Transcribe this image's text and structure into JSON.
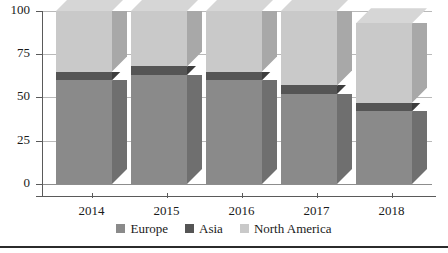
{
  "chart_data": {
    "type": "bar",
    "subtype": "stacked-3d-column",
    "title": "",
    "xlabel": "",
    "ylabel": "",
    "categories": [
      "2014",
      "2015",
      "2016",
      "2017",
      "2018"
    ],
    "ylim": [
      0,
      100
    ],
    "yticks": [
      0,
      25,
      50,
      75,
      100
    ],
    "ytick_labels": [
      "0",
      "25",
      "50",
      "75",
      "100"
    ],
    "grid": true,
    "legend_position": "bottom",
    "series": [
      {
        "name": "Europe",
        "color": "#8a8a8a",
        "values": [
          60,
          63,
          60,
          52,
          42
        ]
      },
      {
        "name": "Asia",
        "color": "#555555",
        "values": [
          5,
          5,
          5,
          5,
          5
        ]
      },
      {
        "name": "North America",
        "color": "#c9c9c9",
        "values": [
          35,
          32,
          35,
          43,
          46
        ]
      }
    ],
    "totals": [
      100,
      100,
      100,
      100,
      93
    ]
  },
  "legend": {
    "items": [
      {
        "label": "Europe",
        "color": "#8a8a8a"
      },
      {
        "label": "Asia",
        "color": "#555555"
      },
      {
        "label": "North America",
        "color": "#c9c9c9"
      }
    ]
  },
  "axes": {
    "y_labels": [
      "100",
      "75",
      "50",
      "25",
      "0"
    ],
    "x_labels": [
      "2014",
      "2015",
      "2016",
      "2017",
      "2018"
    ]
  },
  "colors": {
    "europe": "#8a8a8a",
    "europe_side": "#6f6f6f",
    "europe_top": "#9b9b9b",
    "asia": "#555555",
    "asia_side": "#3d3d3d",
    "asia_top": "#616161",
    "north_america": "#c9c9c9",
    "north_america_side": "#a8a8a8",
    "north_america_top": "#d6d6d6",
    "gridline": "#b9b9b9",
    "axis": "#5a5a5a",
    "text": "#1a1a1a",
    "rule": "#2b2b2b",
    "background": "#ffffff"
  }
}
